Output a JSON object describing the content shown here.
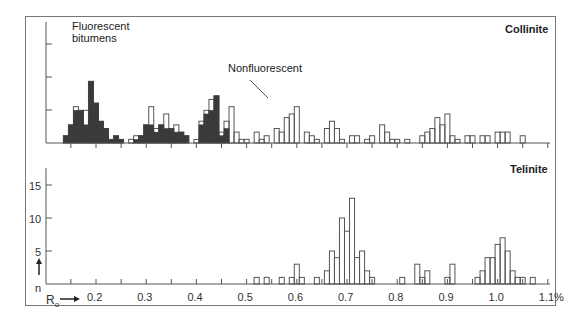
{
  "chart_data": [
    {
      "type": "bar",
      "title": "Collinite",
      "xlabel": "Ro",
      "ylabel": "n",
      "xlim": [
        0.12,
        1.1
      ],
      "bin_width": 0.01,
      "annotations": [
        "Fluorescent bitumens",
        "Nonfluorescent"
      ],
      "legend": [
        "Fluorescent bitumens (filled)",
        "Nonfluorescent (open)"
      ],
      "series": [
        {
          "name": "Fluorescent bitumens",
          "style": "filled",
          "x": [
            0.14,
            0.15,
            0.16,
            0.17,
            0.18,
            0.19,
            0.2,
            0.21,
            0.22,
            0.23,
            0.24,
            0.25,
            0.26,
            0.27,
            0.28,
            0.29,
            0.3,
            0.31,
            0.32,
            0.33,
            0.34,
            0.35,
            0.36,
            0.37,
            0.38,
            0.41,
            0.42,
            0.43,
            0.44,
            0.45,
            0.46,
            0.47
          ],
          "values": [
            2,
            5,
            9,
            9,
            5,
            17,
            11,
            6,
            4,
            1,
            2,
            1,
            0,
            0,
            1,
            2,
            5,
            5,
            3,
            5,
            4,
            4,
            3,
            3,
            2,
            5,
            8,
            9,
            13,
            2,
            4,
            0
          ]
        },
        {
          "name": "Nonfluorescent",
          "style": "open",
          "x": [
            0.14,
            0.15,
            0.16,
            0.17,
            0.18,
            0.19,
            0.2,
            0.21,
            0.22,
            0.23,
            0.24,
            0.25,
            0.26,
            0.27,
            0.28,
            0.29,
            0.3,
            0.31,
            0.32,
            0.33,
            0.34,
            0.35,
            0.36,
            0.37,
            0.38,
            0.4,
            0.41,
            0.42,
            0.43,
            0.44,
            0.45,
            0.46,
            0.47,
            0.48,
            0.49,
            0.5,
            0.51,
            0.52,
            0.53,
            0.54,
            0.55,
            0.56,
            0.57,
            0.58,
            0.59,
            0.6,
            0.62,
            0.63,
            0.64,
            0.65,
            0.66,
            0.67,
            0.68,
            0.69,
            0.7,
            0.71,
            0.72,
            0.73,
            0.74,
            0.75,
            0.77,
            0.78,
            0.79,
            0.8,
            0.81,
            0.82,
            0.85,
            0.86,
            0.87,
            0.88,
            0.89,
            0.9,
            0.91,
            0.92,
            0.93,
            0.94,
            0.95,
            0.97,
            0.98,
            1.0,
            1.01,
            1.02,
            1.03,
            1.05
          ],
          "values": [
            2,
            5,
            10,
            9,
            9,
            17,
            11,
            6,
            4,
            1,
            2,
            1,
            0,
            1,
            2,
            2,
            5,
            10,
            4,
            5,
            8,
            4,
            5,
            3,
            2,
            1,
            6,
            9,
            12,
            13,
            3,
            6,
            10,
            3,
            1,
            1,
            0,
            3,
            1,
            2,
            0,
            4,
            3,
            7,
            8,
            10,
            3,
            2,
            1,
            0,
            4,
            6,
            4,
            1,
            0,
            2,
            2,
            0,
            1,
            2,
            5,
            3,
            1,
            1,
            0,
            1,
            2,
            3,
            4,
            7,
            5,
            8,
            2,
            1,
            0,
            2,
            2,
            2,
            2,
            3,
            3,
            3,
            0,
            2
          ]
        }
      ]
    },
    {
      "type": "bar",
      "title": "Telinite",
      "xlabel": "Ro",
      "ylabel": "n",
      "yticks": [
        5,
        10,
        15
      ],
      "xticks": [
        "0.2",
        "0.3",
        "0.4",
        "0.5",
        "0.6",
        "0.7",
        "0.8",
        "0.9",
        "1.0",
        "1.1%"
      ],
      "xlim": [
        0.12,
        1.1
      ],
      "ylim": [
        0,
        18
      ],
      "bin_width": 0.01,
      "series": [
        {
          "name": "Telinite",
          "style": "open",
          "x": [
            0.52,
            0.54,
            0.57,
            0.59,
            0.6,
            0.61,
            0.62,
            0.64,
            0.66,
            0.67,
            0.68,
            0.69,
            0.7,
            0.71,
            0.72,
            0.73,
            0.74,
            0.75,
            0.76,
            0.77,
            0.81,
            0.84,
            0.85,
            0.86,
            0.9,
            0.91,
            0.96,
            0.97,
            0.98,
            0.99,
            1.0,
            1.01,
            1.02,
            1.03,
            1.04,
            1.05,
            1.07
          ],
          "values": [
            1,
            1,
            1,
            1,
            3,
            1,
            0,
            1,
            2,
            5,
            4,
            10,
            8,
            13,
            4,
            5,
            2,
            1,
            0,
            0,
            1,
            3,
            1,
            2,
            1,
            3,
            1,
            2,
            4,
            4,
            6,
            7,
            5,
            2,
            1,
            1,
            1
          ]
        }
      ]
    }
  ],
  "labels": {
    "top_title": "Collinite",
    "bottom_title": "Telinite",
    "fluorescent": "Fluorescent\nbitumens",
    "fluorescent_line1": "Fluorescent",
    "fluorescent_line2": "bitumens",
    "nonfluorescent": "Nonfluorescent",
    "y_axis": "n",
    "x_axis": "R",
    "x_axis_sub": "o",
    "yticks": [
      "15",
      "10",
      "5"
    ],
    "xticks": [
      "0.2",
      "0.3",
      "0.4",
      "0.5",
      "0.6",
      "0.7",
      "0.8",
      "0.9",
      "1.0",
      "1.1%"
    ]
  },
  "colors": {
    "filled": "#3a3a3a",
    "line": "#555555",
    "frame": "#777777"
  }
}
